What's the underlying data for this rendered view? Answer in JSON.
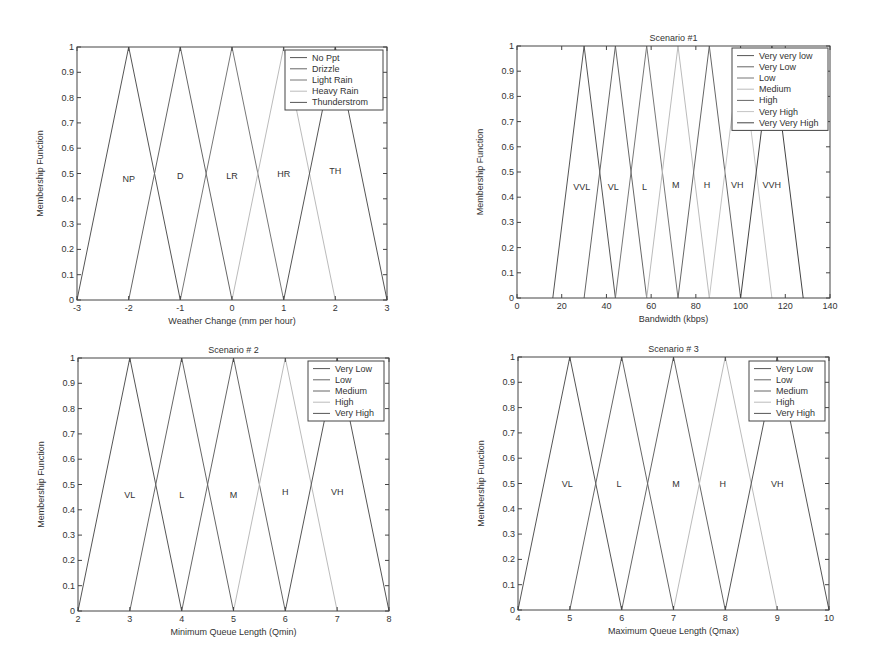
{
  "chart_data": [
    {
      "type": "line",
      "title": "",
      "xlabel": "Weather Change (mm per hour)",
      "ylabel": "Membership Function",
      "xlim": [
        -3,
        3
      ],
      "ylim": [
        0,
        1
      ],
      "xticks": [
        "-3",
        "-2",
        "-1",
        "0",
        "1",
        "2",
        "3"
      ],
      "yticks": [
        "0",
        "0.1",
        "0.2",
        "0.3",
        "0.4",
        "0.5",
        "0.6",
        "0.7",
        "0.8",
        "0.9",
        "1"
      ],
      "grid": false,
      "legend_position": "upper right",
      "series": [
        {
          "name": "No Ppt",
          "abbr": "NP",
          "x": [
            -3,
            -2,
            -1
          ],
          "y": [
            0,
            1,
            0
          ],
          "color": "#555555"
        },
        {
          "name": "Drizzle",
          "abbr": "D",
          "x": [
            -2,
            -1,
            0
          ],
          "y": [
            0,
            1,
            0
          ],
          "color": "#666666"
        },
        {
          "name": "Light Rain",
          "abbr": "LR",
          "x": [
            -1,
            0,
            1
          ],
          "y": [
            0,
            1,
            0
          ],
          "color": "#777777"
        },
        {
          "name": "Heavy Rain",
          "abbr": "HR",
          "x": [
            0,
            1,
            2
          ],
          "y": [
            0,
            1,
            0
          ],
          "color": "#bbbbbb"
        },
        {
          "name": "Thunderstrom",
          "abbr": "TH",
          "x": [
            1,
            2,
            3
          ],
          "y": [
            0,
            1,
            0
          ],
          "color": "#555555"
        }
      ],
      "annotations": [
        {
          "text": "NP",
          "x": -2,
          "y": 0.48
        },
        {
          "text": "D",
          "x": -1,
          "y": 0.49
        },
        {
          "text": "LR",
          "x": 0,
          "y": 0.49
        },
        {
          "text": "HR",
          "x": 1,
          "y": 0.5
        },
        {
          "text": "TH",
          "x": 2,
          "y": 0.51
        }
      ]
    },
    {
      "type": "line",
      "title": "Scenario #1",
      "xlabel": "Bandwidth (kbps)",
      "ylabel": "Membership Function",
      "xlim": [
        0,
        140
      ],
      "ylim": [
        0,
        1
      ],
      "xticks": [
        "0",
        "20",
        "40",
        "60",
        "80",
        "100",
        "120",
        "140"
      ],
      "yticks": [
        "0",
        "0.1",
        "0.2",
        "0.3",
        "0.4",
        "0.5",
        "0.6",
        "0.7",
        "0.8",
        "0.9",
        "1"
      ],
      "grid": false,
      "legend_position": "upper right",
      "series": [
        {
          "name": "Very very low",
          "abbr": "VVL",
          "x": [
            16,
            30,
            44
          ],
          "y": [
            0,
            1,
            0
          ],
          "color": "#555555"
        },
        {
          "name": "Very Low",
          "abbr": "VL",
          "x": [
            30,
            44,
            58
          ],
          "y": [
            0,
            1,
            0
          ],
          "color": "#666666"
        },
        {
          "name": "Low",
          "abbr": "L",
          "x": [
            44,
            58,
            72
          ],
          "y": [
            0,
            1,
            0
          ],
          "color": "#777777"
        },
        {
          "name": "Medium",
          "abbr": "M",
          "x": [
            58,
            72,
            86
          ],
          "y": [
            0,
            1,
            0
          ],
          "color": "#bbbbbb"
        },
        {
          "name": "High",
          "abbr": "H",
          "x": [
            72,
            86,
            100
          ],
          "y": [
            0,
            1,
            0
          ],
          "color": "#666666"
        },
        {
          "name": "Very High",
          "abbr": "VH",
          "x": [
            86,
            100,
            114
          ],
          "y": [
            0,
            1,
            0
          ],
          "color": "#c4c4c4"
        },
        {
          "name": "Very Very High",
          "abbr": "VVH",
          "x": [
            100,
            114,
            128
          ],
          "y": [
            0,
            1,
            0
          ],
          "color": "#444444"
        }
      ],
      "annotations": [
        {
          "text": "VVL",
          "x": 29,
          "y": 0.44
        },
        {
          "text": "VL",
          "x": 43,
          "y": 0.44
        },
        {
          "text": "L",
          "x": 57,
          "y": 0.44
        },
        {
          "text": "M",
          "x": 71,
          "y": 0.45
        },
        {
          "text": "H",
          "x": 85,
          "y": 0.45
        },
        {
          "text": "VH",
          "x": 98.5,
          "y": 0.45
        },
        {
          "text": "VVH",
          "x": 114,
          "y": 0.45
        }
      ]
    },
    {
      "type": "line",
      "title": "Scenario # 2",
      "xlabel": "Minimum Queue Length (Qmin)",
      "ylabel": "Membership Function",
      "xlim": [
        2,
        8
      ],
      "ylim": [
        0,
        1
      ],
      "xticks": [
        "2",
        "3",
        "4",
        "5",
        "6",
        "7",
        "8"
      ],
      "yticks": [
        "0",
        "0.1",
        "0.2",
        "0.3",
        "0.4",
        "0.5",
        "0.6",
        "0.7",
        "0.8",
        "0.9",
        "1"
      ],
      "grid": false,
      "legend_position": "upper right",
      "series": [
        {
          "name": "Very Low",
          "abbr": "VL",
          "x": [
            2,
            3,
            4
          ],
          "y": [
            0,
            1,
            0
          ],
          "color": "#555555"
        },
        {
          "name": "Low",
          "abbr": "L",
          "x": [
            3,
            4,
            5
          ],
          "y": [
            0,
            1,
            0
          ],
          "color": "#666666"
        },
        {
          "name": "Medium",
          "abbr": "M",
          "x": [
            4,
            5,
            6
          ],
          "y": [
            0,
            1,
            0
          ],
          "color": "#666666"
        },
        {
          "name": "High",
          "abbr": "H",
          "x": [
            5,
            6,
            7
          ],
          "y": [
            0,
            1,
            0
          ],
          "color": "#bbbbbb"
        },
        {
          "name": "Very High",
          "abbr": "VH",
          "x": [
            6,
            7,
            8
          ],
          "y": [
            0,
            1,
            0
          ],
          "color": "#555555"
        }
      ],
      "annotations": [
        {
          "text": "VL",
          "x": 3,
          "y": 0.46
        },
        {
          "text": "L",
          "x": 4,
          "y": 0.46
        },
        {
          "text": "M",
          "x": 5,
          "y": 0.46
        },
        {
          "text": "H",
          "x": 6,
          "y": 0.47
        },
        {
          "text": "VH",
          "x": 7,
          "y": 0.47
        }
      ]
    },
    {
      "type": "line",
      "title": "Scenario # 3",
      "xlabel": "Maximum Queue Length (Qmax)",
      "ylabel": "Membership Function",
      "xlim": [
        4,
        10
      ],
      "ylim": [
        0,
        1
      ],
      "xticks": [
        "4",
        "5",
        "6",
        "7",
        "8",
        "9",
        "10"
      ],
      "yticks": [
        "0",
        "0.1",
        "0.2",
        "0.3",
        "0.4",
        "0.5",
        "0.6",
        "0.7",
        "0.8",
        "0.9",
        "1"
      ],
      "grid": false,
      "legend_position": "upper right",
      "series": [
        {
          "name": "Very Low",
          "abbr": "VL",
          "x": [
            4,
            5,
            6
          ],
          "y": [
            0,
            1,
            0
          ],
          "color": "#555555"
        },
        {
          "name": "Low",
          "abbr": "L",
          "x": [
            5,
            6,
            7
          ],
          "y": [
            0,
            1,
            0
          ],
          "color": "#666666"
        },
        {
          "name": "Medium",
          "abbr": "M",
          "x": [
            6,
            7,
            8
          ],
          "y": [
            0,
            1,
            0
          ],
          "color": "#666666"
        },
        {
          "name": "High",
          "abbr": "H",
          "x": [
            7,
            8,
            9
          ],
          "y": [
            0,
            1,
            0
          ],
          "color": "#bbbbbb"
        },
        {
          "name": "Very High",
          "abbr": "VH",
          "x": [
            8,
            9,
            10
          ],
          "y": [
            0,
            1,
            0
          ],
          "color": "#555555"
        }
      ],
      "annotations": [
        {
          "text": "VL",
          "x": 4.95,
          "y": 0.5
        },
        {
          "text": "L",
          "x": 5.95,
          "y": 0.5
        },
        {
          "text": "M",
          "x": 7.05,
          "y": 0.5
        },
        {
          "text": "H",
          "x": 7.95,
          "y": 0.5
        },
        {
          "text": "VH",
          "x": 9,
          "y": 0.5
        }
      ]
    }
  ],
  "layout": {
    "axes_px": [
      {
        "left": 77,
        "top": 47,
        "right": 387,
        "bottom": 300,
        "legend": {
          "right": 383,
          "top": 50,
          "width": 98
        }
      },
      {
        "left": 517,
        "top": 46,
        "right": 830,
        "bottom": 298,
        "legend": {
          "right": 828,
          "top": 48,
          "width": 96
        }
      },
      {
        "left": 78,
        "top": 358,
        "right": 389,
        "bottom": 611,
        "legend": {
          "right": 384,
          "top": 361,
          "width": 76
        }
      },
      {
        "left": 518,
        "top": 357,
        "right": 829,
        "bottom": 610,
        "legend": {
          "right": 825,
          "top": 361,
          "width": 76
        }
      }
    ]
  }
}
